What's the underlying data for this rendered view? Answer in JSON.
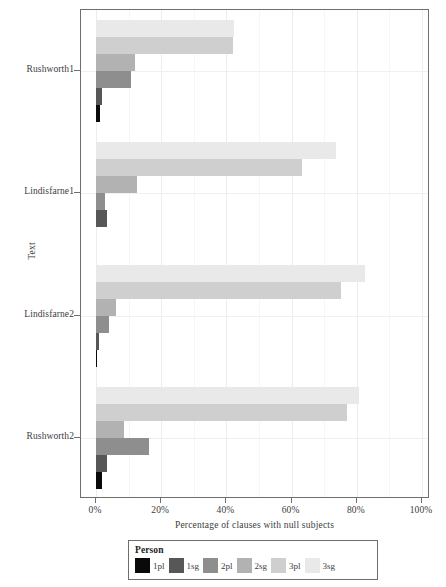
{
  "chart_data": {
    "type": "bar",
    "orientation": "horizontal",
    "grouped": true,
    "title": "",
    "xlabel": "Percentage of clauses with null subjects",
    "ylabel": "Text",
    "xlim": [
      0,
      100
    ],
    "xticks": [
      "0%",
      "20%",
      "40%",
      "60%",
      "80%",
      "100%"
    ],
    "xtick_values": [
      0,
      20,
      40,
      60,
      80,
      100
    ],
    "grid": true,
    "legend_position": "bottom",
    "legend_title": "Person",
    "categories": [
      "Rushworth1",
      "Lindisfarne1",
      "Lindisfarne2",
      "Rushworth2"
    ],
    "series": [
      {
        "name": "1pl",
        "color": "#0a0a0a",
        "values": [
          1.3,
          0.0,
          0.3,
          1.8
        ]
      },
      {
        "name": "1sg",
        "color": "#575757",
        "values": [
          1.8,
          3.4,
          0.8,
          3.4
        ]
      },
      {
        "name": "2pl",
        "color": "#8e8e8e",
        "values": [
          10.8,
          2.8,
          4.1,
          16.4
        ]
      },
      {
        "name": "2sg",
        "color": "#b2b2b2",
        "values": [
          12.0,
          12.6,
          6.1,
          8.6
        ]
      },
      {
        "name": "3pl",
        "color": "#cfcfcf",
        "values": [
          42.0,
          63.2,
          75.3,
          77.0
        ]
      },
      {
        "name": "3sg",
        "color": "#e9e9e9",
        "values": [
          42.3,
          73.6,
          82.4,
          80.8
        ]
      }
    ]
  },
  "axes": {
    "y_title": "Text",
    "x_title": "Percentage of clauses with null subjects",
    "y_tick_labels": [
      "Rushworth1",
      "Lindisfarne1",
      "Lindisfarne2",
      "Rushworth2"
    ],
    "x_tick_labels": [
      "0%",
      "20%",
      "40%",
      "60%",
      "80%",
      "100%"
    ]
  },
  "legend": {
    "title": "Person",
    "items": [
      {
        "label": "1pl",
        "color": "#0a0a0a"
      },
      {
        "label": "1sg",
        "color": "#575757"
      },
      {
        "label": "2pl",
        "color": "#8e8e8e"
      },
      {
        "label": "2sg",
        "color": "#b2b2b2"
      },
      {
        "label": "3pl",
        "color": "#cfcfcf"
      },
      {
        "label": "3sg",
        "color": "#e9e9e9"
      }
    ]
  }
}
